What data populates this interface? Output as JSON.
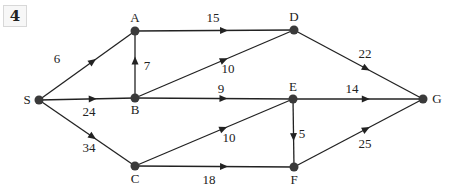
{
  "problem_number": "4",
  "graph": {
    "type": "directed-weighted",
    "colors": {
      "edge": "#222222",
      "node": "#3a3a3a",
      "text": "#222222"
    },
    "nodes": [
      {
        "id": "S",
        "label": "S"
      },
      {
        "id": "A",
        "label": "A"
      },
      {
        "id": "B",
        "label": "B"
      },
      {
        "id": "C",
        "label": "C"
      },
      {
        "id": "D",
        "label": "D"
      },
      {
        "id": "E",
        "label": "E"
      },
      {
        "id": "F",
        "label": "F"
      },
      {
        "id": "G",
        "label": "G"
      }
    ],
    "edges": [
      {
        "from": "S",
        "to": "A",
        "weight": "6"
      },
      {
        "from": "S",
        "to": "B",
        "weight": "24"
      },
      {
        "from": "S",
        "to": "C",
        "weight": "34"
      },
      {
        "from": "B",
        "to": "A",
        "weight": "7"
      },
      {
        "from": "A",
        "to": "D",
        "weight": "15"
      },
      {
        "from": "B",
        "to": "D",
        "weight": "10"
      },
      {
        "from": "B",
        "to": "E",
        "weight": "9"
      },
      {
        "from": "C",
        "to": "E",
        "weight": "10"
      },
      {
        "from": "C",
        "to": "F",
        "weight": "18"
      },
      {
        "from": "E",
        "to": "F",
        "weight": "5"
      },
      {
        "from": "D",
        "to": "G",
        "weight": "22"
      },
      {
        "from": "E",
        "to": "G",
        "weight": "14"
      },
      {
        "from": "F",
        "to": "G",
        "weight": "25"
      }
    ]
  }
}
